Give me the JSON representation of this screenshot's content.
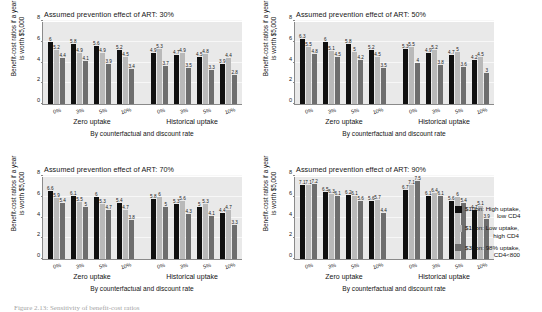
{
  "figure": {
    "caption": "Figure 2.13: Sensitivity of benefit-cost ratios",
    "axis": {
      "y_title_line1": "Benefit-cost ratios if a year",
      "y_title_line2": "is worth $5,000",
      "y_ticks": [
        "0",
        "2",
        "4",
        "6",
        "8"
      ],
      "y_min": 0,
      "y_max": 8,
      "x_ticks": [
        "0%",
        "3%",
        "5%",
        "10%",
        "0%",
        "3%",
        "5%",
        "10%"
      ],
      "x_group_labels": [
        "Zero uptake",
        "Historical uptake"
      ],
      "x_title": "By counterfactual and discount rate"
    },
    "legend": [
      {
        "label_line1": "$10bn: High uptake,",
        "label_line2": "low CD4",
        "color": "#101010"
      },
      {
        "label_line1": "$10bn: Low uptake,",
        "label_line2": "high CD4",
        "color": "#b9b9b9"
      },
      {
        "label_line1": "$30bn: 98% uptake,",
        "label_line2": "CD4<800",
        "color": "#6e6e6e"
      }
    ]
  },
  "chart_data": [
    {
      "type": "bar",
      "title": "Assumed prevention effect of ART: 30%",
      "xlabel": "By counterfactual and discount rate",
      "ylabel": "Benefit-cost ratios if a year is worth $5,000",
      "ylim": [
        0,
        8
      ],
      "grid": true,
      "legend_position": "right",
      "categories": [
        "0%",
        "3%",
        "5%",
        "10%",
        "0%",
        "3%",
        "5%",
        "10%"
      ],
      "group_labels": [
        "Zero uptake",
        "Historical uptake"
      ],
      "series": [
        {
          "name": "$10bn: High uptake, low CD4",
          "values": [
            6,
            5.8,
            5.6,
            5.2,
            4.9,
            4.7,
            4.5,
            3.9
          ]
        },
        {
          "name": "$10bn: Low uptake, high CD4",
          "values": [
            5.2,
            4.9,
            4.9,
            4.5,
            5.3,
            4.9,
            4.8,
            4.4
          ]
        },
        {
          "name": "$30bn: 98% uptake, CD4<800",
          "values": [
            4.4,
            4.1,
            3.9,
            3.4,
            3.7,
            3.5,
            3.3,
            2.8
          ]
        }
      ]
    },
    {
      "type": "bar",
      "title": "Assumed prevention effect of ART: 50%",
      "xlabel": "By counterfactual and discount rate",
      "ylabel": "Benefit-cost ratios if a year is worth $5,000",
      "ylim": [
        0,
        8
      ],
      "grid": true,
      "legend_position": "right",
      "categories": [
        "0%",
        "3%",
        "5%",
        "10%",
        "0%",
        "3%",
        "5%",
        "10%"
      ],
      "group_labels": [
        "Zero uptake",
        "Historical uptake"
      ],
      "series": [
        {
          "name": "$10bn: High uptake, low CD4",
          "values": [
            6.3,
            6,
            5.8,
            5.2,
            5.3,
            4.9,
            4.7,
            4.2
          ]
        },
        {
          "name": "$10bn: Low uptake, high CD4",
          "values": [
            5.5,
            5.1,
            5,
            4.5,
            5.5,
            5.2,
            5,
            4.5
          ]
        },
        {
          "name": "$30bn: 98% uptake, CD4<800",
          "values": [
            4.8,
            4.5,
            4.2,
            3.5,
            4,
            3.8,
            3.6,
            3
          ]
        }
      ]
    },
    {
      "type": "bar",
      "title": "Assumed prevention effect of ART: 70%",
      "xlabel": "By counterfactual and discount rate",
      "ylabel": "Benefit-cost ratios if a year is worth $5,000",
      "ylim": [
        0,
        8
      ],
      "grid": true,
      "legend_position": "right",
      "categories": [
        "0%",
        "3%",
        "5%",
        "10%",
        "0%",
        "3%",
        "5%",
        "10%"
      ],
      "group_labels": [
        "Zero uptake",
        "Historical uptake"
      ],
      "series": [
        {
          "name": "$10bn: High uptake, low CD4",
          "values": [
            6.6,
            6.1,
            6,
            5.4,
            5.8,
            5.3,
            5,
            4.4
          ]
        },
        {
          "name": "$10bn: Low uptake, high CD4",
          "values": [
            5.9,
            5.5,
            5.3,
            4.7,
            6,
            5.6,
            5.3,
            4.7
          ]
        },
        {
          "name": "$30bn: 98% uptake, CD4<800",
          "values": [
            5.4,
            5,
            4.7,
            3.8,
            5,
            4.3,
            4.1,
            3.3
          ]
        }
      ]
    },
    {
      "type": "bar",
      "title": "Assumed prevention effect of ART: 90%",
      "xlabel": "By counterfactual and discount rate",
      "ylabel": "Benefit-cost ratios if a year is worth $5,000",
      "ylim": [
        0,
        8
      ],
      "grid": true,
      "legend_position": "right",
      "categories": [
        "0%",
        "3%",
        "5%",
        "10%",
        "0%",
        "3%",
        "5%",
        "10%"
      ],
      "group_labels": [
        "Zero uptake",
        "Historical uptake"
      ],
      "series": [
        {
          "name": "$10bn: High uptake, low CD4",
          "values": [
            7.1,
            6.5,
            6.2,
            5.6,
            6.7,
            6.1,
            5.6,
            4.7
          ]
        },
        {
          "name": "$10bn: Low uptake, high CD4",
          "values": [
            7.1,
            6.3,
            6.1,
            5.7,
            7.1,
            6.4,
            6,
            5.1
          ]
        },
        {
          "name": "$30bn: 98% uptake, CD4<800",
          "values": [
            7.2,
            6.1,
            5.6,
            4.4,
            7.5,
            6.1,
            5.4,
            3.9
          ]
        }
      ]
    }
  ]
}
